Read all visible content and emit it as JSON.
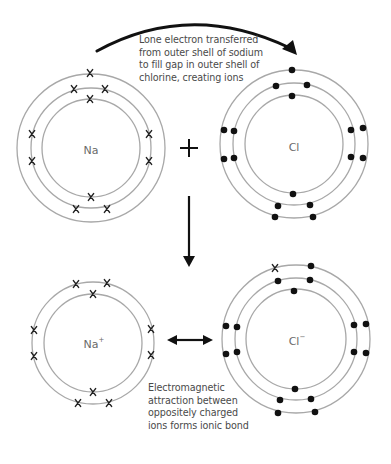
{
  "diagram": {
    "colors": {
      "shell": "#a8a8a8",
      "electron": "#111111",
      "arrow": "#111111",
      "text": "#4a4a4a",
      "label": "#6a6a6a"
    },
    "atoms": {
      "na_atom": {
        "symbol": "Na",
        "charge": "",
        "electron_marker": "x",
        "shells": [
          2,
          8,
          1
        ]
      },
      "cl_atom": {
        "symbol": "Cl",
        "charge": "",
        "electron_marker": "dot",
        "shells": [
          2,
          8,
          7
        ]
      },
      "na_ion": {
        "symbol": "Na",
        "charge": "+",
        "electron_marker": "x",
        "shells": [
          2,
          8
        ]
      },
      "cl_ion": {
        "symbol": "Cl",
        "charge": "−",
        "electron_marker": "dot",
        "shells": [
          2,
          8,
          8
        ],
        "transferred_electron_marker": "x"
      }
    },
    "operators": {
      "plus": "+",
      "reaction_arrow": "down-arrow",
      "attraction_arrow": "double-headed-arrow",
      "transfer_arrow": "curved-arrow"
    },
    "captions": {
      "transfer": [
        "Lone electron transferred",
        "from outer shell of sodium",
        "to fill gap in outer shell of",
        "chlorine, creating ions"
      ],
      "bond": [
        "Electromagnetic",
        "attraction between",
        "oppositely charged",
        "ions forms ionic bond"
      ]
    }
  }
}
